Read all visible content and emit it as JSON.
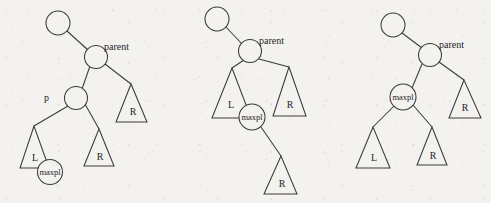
{
  "figure": {
    "title": "",
    "background_color": "#f4f2ef",
    "stroke_color": "#3a3a3a",
    "panels": [
      {
        "id": "panel-1",
        "name": "before-deletion",
        "nodes": [
          {
            "name": "grandparent",
            "label": "",
            "cx": 58,
            "cy": 23,
            "r": 12
          },
          {
            "name": "parent",
            "label": "",
            "cx": 96,
            "cy": 57,
            "r": 11.5
          },
          {
            "name": "p",
            "label": "",
            "cx": 76,
            "cy": 98,
            "r": 11.5
          },
          {
            "name": "maxpl",
            "label": "maxpl",
            "cx": 50,
            "cy": 172,
            "r": 12.5
          }
        ],
        "side_labels": [
          {
            "name": "parent-label",
            "text": "parent",
            "x": 104,
            "y": 50
          },
          {
            "name": "p-label",
            "text": "p",
            "x": 45,
            "y": 101
          }
        ],
        "triangles": [
          {
            "name": "subtree-R-right-of-parent",
            "label": "R",
            "apex_x": 131,
            "apex_y": 84,
            "base_left_x": 116,
            "base_right_x": 147,
            "base_y": 122
          },
          {
            "name": "subtree-L-of-p",
            "label": "L",
            "apex_x": 34,
            "apex_y": 126,
            "base_left_x": 20,
            "base_right_x": 49,
            "base_y": 168
          },
          {
            "name": "subtree-R-of-p",
            "label": "R",
            "apex_x": 99,
            "apex_y": 129,
            "base_left_x": 84,
            "base_right_x": 114,
            "base_y": 166
          }
        ],
        "edges": [
          {
            "name": "edge-grandparent-parent",
            "x1": 67,
            "y1": 31,
            "x2": 88,
            "y2": 50
          },
          {
            "name": "edge-parent-p",
            "x1": 89,
            "y1": 65,
            "x2": 82,
            "y2": 89
          },
          {
            "name": "edge-parent-R",
            "x1": 105,
            "y1": 64,
            "x2": 131,
            "y2": 84
          },
          {
            "name": "edge-p-L",
            "x1": 68,
            "y1": 105,
            "x2": 34,
            "y2": 126
          },
          {
            "name": "edge-p-R",
            "x1": 84,
            "y1": 105,
            "x2": 99,
            "y2": 129
          }
        ]
      },
      {
        "id": "panel-2",
        "name": "maxpl-promoted-step",
        "nodes": [
          {
            "name": "grandparent",
            "label": "",
            "cx": 217,
            "cy": 19,
            "r": 12
          },
          {
            "name": "parent",
            "label": "",
            "cx": 250,
            "cy": 51,
            "r": 11.5
          },
          {
            "name": "maxpl",
            "label": "maxpl",
            "cx": 252,
            "cy": 117,
            "r": 13
          }
        ],
        "side_labels": [
          {
            "name": "parent-label",
            "text": "parent",
            "x": 259,
            "y": 44
          }
        ],
        "triangles": [
          {
            "name": "subtree-L",
            "label": "L",
            "apex_x": 232,
            "apex_y": 68,
            "base_left_x": 212,
            "base_right_x": 251,
            "base_y": 118
          },
          {
            "name": "subtree-R-right-of-parent",
            "label": "R",
            "apex_x": 289,
            "apex_y": 67,
            "base_left_x": 273,
            "base_right_x": 306,
            "base_y": 116
          },
          {
            "name": "subtree-R-of-maxpl",
            "label": "R",
            "apex_x": 281,
            "apex_y": 156,
            "base_left_x": 264,
            "base_right_x": 297,
            "base_y": 194
          }
        ],
        "edges": [
          {
            "name": "edge-grandparent-parent",
            "x1": 226,
            "y1": 27,
            "x2": 242,
            "y2": 44
          },
          {
            "name": "edge-parent-L",
            "x1": 243,
            "y1": 59,
            "x2": 232,
            "y2": 68
          },
          {
            "name": "edge-parent-R",
            "x1": 258,
            "y1": 59,
            "x2": 289,
            "y2": 67
          },
          {
            "name": "edge-maxpl-R",
            "x1": 260,
            "y1": 127,
            "x2": 281,
            "y2": 156
          }
        ]
      },
      {
        "id": "panel-3",
        "name": "after-deletion",
        "nodes": [
          {
            "name": "grandparent",
            "label": "",
            "cx": 393,
            "cy": 25,
            "r": 12
          },
          {
            "name": "parent",
            "label": "",
            "cx": 430,
            "cy": 55,
            "r": 11.5
          },
          {
            "name": "maxpl",
            "label": "maxpl",
            "cx": 403,
            "cy": 97,
            "r": 13
          }
        ],
        "side_labels": [
          {
            "name": "parent-label",
            "text": "parent",
            "x": 439,
            "y": 48
          }
        ],
        "triangles": [
          {
            "name": "subtree-R-right-of-parent",
            "label": "R",
            "apex_x": 464,
            "apex_y": 80,
            "base_left_x": 449,
            "base_right_x": 481,
            "base_y": 118
          },
          {
            "name": "subtree-L-of-maxpl",
            "label": "L",
            "apex_x": 373,
            "apex_y": 127,
            "base_left_x": 356,
            "base_right_x": 390,
            "base_y": 168
          },
          {
            "name": "subtree-R-of-maxpl",
            "label": "R",
            "apex_x": 432,
            "apex_y": 127,
            "base_left_x": 417,
            "base_right_x": 447,
            "base_y": 165
          }
        ],
        "edges": [
          {
            "name": "edge-grandparent-parent",
            "x1": 402,
            "y1": 33,
            "x2": 422,
            "y2": 48
          },
          {
            "name": "edge-parent-maxpl",
            "x1": 421,
            "y1": 63,
            "x2": 411,
            "y2": 88
          },
          {
            "name": "edge-parent-R",
            "x1": 439,
            "y1": 62,
            "x2": 464,
            "y2": 80
          },
          {
            "name": "edge-maxpl-L",
            "x1": 394,
            "y1": 105,
            "x2": 373,
            "y2": 127
          },
          {
            "name": "edge-maxpl-R",
            "x1": 412,
            "y1": 105,
            "x2": 432,
            "y2": 127
          }
        ]
      }
    ]
  }
}
